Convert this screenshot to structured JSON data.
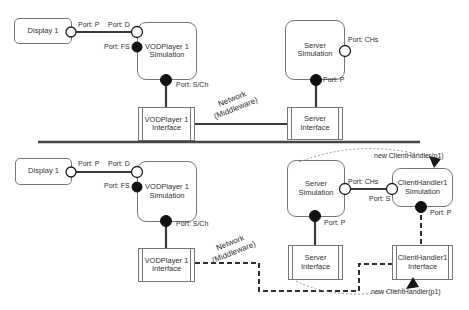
{
  "colors": {
    "line": "#3a3a3a",
    "box_border": "#767676",
    "text": "#2e2e2e",
    "arc": "#979797",
    "background": "#ffffff"
  },
  "top": {
    "display_box": "Display 1",
    "vod_sim_line1": "VODPlayer 1",
    "vod_sim_line2": "Simulation",
    "server_sim_line1": "Server",
    "server_sim_line2": "Simulation",
    "vod_iface_line1": "VODPlayer 1",
    "vod_iface_line2": "Interface",
    "server_iface_line1": "Server",
    "server_iface_line2": "Interface",
    "port_p_display": "Port: P",
    "port_d": "Port: D",
    "port_fs": "Port: FS",
    "port_sch": "Port: S/Ch",
    "port_chs": "Port: CHs",
    "port_p_server": "Port: P",
    "network_line1": "Network",
    "network_line2": "(Middleware)"
  },
  "bottom": {
    "display_box": "Display 1",
    "vod_sim_line1": "VODPlayer 1",
    "vod_sim_line2": "Simulation",
    "server_sim_line1": "Server",
    "server_sim_line2": "Simulation",
    "ch_sim_line1": "ClientHandler1",
    "ch_sim_line2": "Simulation",
    "vod_iface_line1": "VODPlayer 1",
    "vod_iface_line2": "Interface",
    "server_iface_line1": "Server",
    "server_iface_line2": "Interface",
    "ch_iface_line1": "ClientHandler1",
    "ch_iface_line2": "Interface",
    "port_p_display": "Port: P",
    "port_d": "Port: D",
    "port_fs": "Port: FS",
    "port_sch": "Port: S/Ch",
    "port_chs": "Port: CHs",
    "port_s": "Port: S",
    "port_p_server": "Port: P",
    "port_p_ch": "Port: P",
    "new_handler_top": "new ClientHandler(p1)",
    "new_handler_bottom": "new ClientHandler(p1)",
    "network_line1": "Network",
    "network_line2": "(Middleware)"
  }
}
